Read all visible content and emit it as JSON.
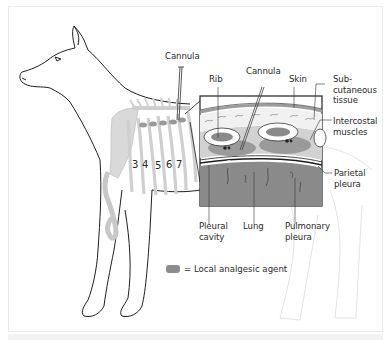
{
  "diagram": {
    "colors": {
      "outline": "#1e1e1e",
      "skeleton": "#d6d6d6",
      "lung": "#8a8a8a",
      "analgesic": "#8c8c8c",
      "skin": "#bdbdbd",
      "hind_ghost": "#e6e6e6"
    },
    "labels": {
      "cannula_main": "Cannula",
      "rib": "Rib",
      "cannula_inset": "Cannula",
      "skin": "Skin",
      "subcutaneous": "Sub-\ncutaneous\ntissue",
      "intercostal": "Intercostal\nmuscles",
      "parietal": "Parietal\npleura",
      "pleural_cavity": "Pleural\ncavity",
      "lung": "Lung",
      "pulmonary": "Pulmonary\npleura"
    },
    "rib_numbers": [
      "3",
      "4",
      "5",
      "6",
      "7"
    ],
    "legend": {
      "swatch_label": "local-analgesic-swatch",
      "text": "= Local analgesic agent"
    }
  }
}
